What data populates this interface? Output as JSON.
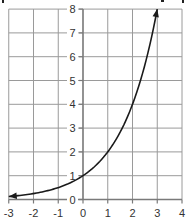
{
  "chart_data": {
    "type": "line",
    "title": "",
    "xlabel": "",
    "ylabel": "",
    "function": "y = 2^x",
    "xlim": [
      -3,
      4
    ],
    "ylim": [
      0,
      8
    ],
    "grid": true,
    "legend": null,
    "x_ticks": [
      -3,
      -2,
      -1,
      0,
      1,
      2,
      3,
      4
    ],
    "y_ticks": [
      0,
      1,
      2,
      3,
      4,
      5,
      6,
      7,
      8
    ],
    "series": [
      {
        "name": "exponential curve",
        "x": [
          -3,
          -2.5,
          -2,
          -1.5,
          -1,
          -0.5,
          0,
          0.5,
          1,
          1.5,
          2,
          2.5,
          3
        ],
        "y": [
          0.125,
          0.177,
          0.25,
          0.354,
          0.5,
          0.707,
          1,
          1.414,
          2,
          2.828,
          4,
          5.657,
          8
        ],
        "arrows": "both ends"
      }
    ]
  },
  "colors": {
    "grid": "#9a9a9a",
    "axis": "#7a7a7a",
    "curve": "#1a1a1a",
    "label": "#333333"
  },
  "labels": {
    "x_ticks": [
      "-3",
      "-2",
      "-1",
      "0",
      "1",
      "2",
      "3",
      "4"
    ],
    "y_ticks": [
      "0",
      "1",
      "2",
      "3",
      "4",
      "5",
      "6",
      "7",
      "8"
    ]
  }
}
